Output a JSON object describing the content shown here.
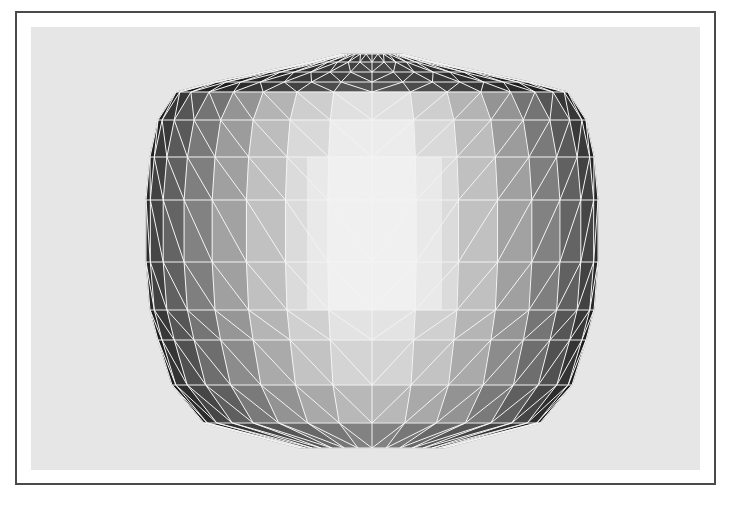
{
  "figure": {
    "caption": "Shaded triangulated 3D mesh of a vase / jar shape",
    "frame": {
      "x": 15,
      "y": 11,
      "w": 701,
      "h": 474,
      "border": "#4a4a4a"
    },
    "panel": {
      "x": 31,
      "y": 27,
      "w": 669,
      "h": 443,
      "fill": "#e6e6e6"
    },
    "wire_color": "#f4f4f4",
    "center_x": 372,
    "rows": [
      {
        "y": 54,
        "half_width": 30
      },
      {
        "y": 62,
        "half_width": 62
      },
      {
        "y": 72,
        "half_width": 110
      },
      {
        "y": 82,
        "half_width": 158
      },
      {
        "y": 92,
        "half_width": 196
      },
      {
        "y": 120,
        "half_width": 214
      },
      {
        "y": 157,
        "half_width": 222
      },
      {
        "y": 200,
        "half_width": 226
      },
      {
        "y": 262,
        "half_width": 226
      },
      {
        "y": 310,
        "half_width": 222
      },
      {
        "y": 340,
        "half_width": 214
      },
      {
        "y": 385,
        "half_width": 200
      },
      {
        "y": 423,
        "half_width": 168
      },
      {
        "y": 448,
        "half_width": 72
      }
    ],
    "columns": 16,
    "column_shades": [
      "#1e1e1e",
      "#3a3a3a",
      "#5a5a5a",
      "#7a7a7a",
      "#9c9c9c",
      "#bdbdbd",
      "#d9d9d9",
      "#ececec",
      "#ececec",
      "#d9d9d9",
      "#bdbdbd",
      "#9c9c9c",
      "#7a7a7a",
      "#5a5a5a",
      "#3a3a3a",
      "#1e1e1e"
    ],
    "row_shade_offsets": [
      -0.75,
      -0.7,
      -0.7,
      -0.65,
      -0.05,
      0.0,
      0.04,
      0.06,
      0.04,
      -0.04,
      -0.1,
      -0.22,
      -0.45
    ],
    "highlight": {
      "x": 307,
      "y": 157,
      "w": 135,
      "h": 153,
      "fill": "#f2f2f2"
    }
  }
}
